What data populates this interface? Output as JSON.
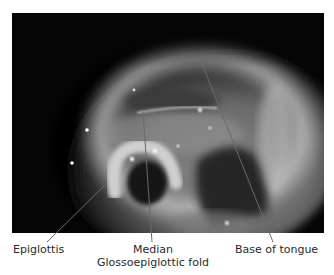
{
  "figure": {
    "image_description": "Endoscopic view of the larynx/oropharynx showing epiglottis, median glossoepiglottic fold and base of tongue",
    "labels": {
      "epiglottis": "Epiglottis",
      "median_line1": "Median",
      "median_line2": "Glossoepiglottic fold",
      "base_of_tongue": "Base of tongue"
    },
    "colors": {
      "background": "#ffffff",
      "photo_dark": "#050505",
      "tissue_light": "#d8d8d8",
      "leader_line": "#6a6a6a",
      "label_text": "#2a2a2a"
    }
  }
}
